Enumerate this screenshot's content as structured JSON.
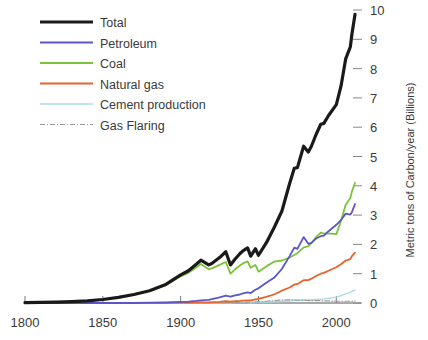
{
  "chart_data": {
    "type": "line",
    "title": "",
    "subtitle": "",
    "xlabel": "",
    "ylabel": "Metric tons of Carbon/year (Billions)",
    "ylabel_position": "right",
    "xlim": [
      1800,
      2012
    ],
    "ylim": [
      0,
      10
    ],
    "xticks": [
      1800,
      1850,
      1900,
      1950,
      2000
    ],
    "xtick_labels": [
      "1800",
      "1850",
      "1900",
      "1950",
      "2000"
    ],
    "yticks": [
      0,
      1,
      2,
      3,
      4,
      5,
      6,
      7,
      8,
      9,
      10
    ],
    "ytick_labels": [
      "0",
      "1",
      "2",
      "3",
      "4",
      "5",
      "6",
      "7",
      "8",
      "9",
      "10"
    ],
    "grid": false,
    "legend_position": "upper-left",
    "x": [
      1800,
      1810,
      1820,
      1830,
      1840,
      1850,
      1860,
      1870,
      1880,
      1890,
      1900,
      1905,
      1910,
      1913,
      1918,
      1920,
      1925,
      1929,
      1932,
      1935,
      1938,
      1940,
      1943,
      1945,
      1948,
      1950,
      1955,
      1960,
      1965,
      1970,
      1973,
      1975,
      1979,
      1982,
      1984,
      1987,
      1990,
      1992,
      1995,
      2000,
      2003,
      2006,
      2009,
      2010,
      2012
    ],
    "series": [
      {
        "name": "Total",
        "color": "#1a1a1a",
        "linewidth": 3.2,
        "style": "solid",
        "values": [
          0.01,
          0.02,
          0.03,
          0.05,
          0.07,
          0.12,
          0.19,
          0.29,
          0.42,
          0.62,
          0.96,
          1.1,
          1.32,
          1.46,
          1.3,
          1.35,
          1.55,
          1.75,
          1.3,
          1.5,
          1.68,
          1.78,
          1.88,
          1.6,
          1.85,
          1.63,
          2.05,
          2.57,
          3.13,
          4.08,
          4.6,
          4.62,
          5.35,
          5.15,
          5.35,
          5.75,
          6.1,
          6.13,
          6.4,
          6.77,
          7.4,
          8.33,
          8.74,
          9.17,
          9.85
        ]
      },
      {
        "name": "Petroleum",
        "color": "#5b55c9",
        "linewidth": 1.8,
        "style": "solid",
        "values": [
          0,
          0,
          0,
          0,
          0,
          0,
          0,
          0,
          0.01,
          0.02,
          0.04,
          0.05,
          0.07,
          0.09,
          0.11,
          0.13,
          0.19,
          0.25,
          0.22,
          0.26,
          0.29,
          0.33,
          0.36,
          0.34,
          0.45,
          0.5,
          0.69,
          0.86,
          1.16,
          1.6,
          1.89,
          1.85,
          2.25,
          2.02,
          2.05,
          2.2,
          2.28,
          2.3,
          2.45,
          2.67,
          2.83,
          3.05,
          3.02,
          3.1,
          3.38
        ]
      },
      {
        "name": "Coal",
        "color": "#7cc23a",
        "linewidth": 1.8,
        "style": "solid",
        "values": [
          0.01,
          0.02,
          0.03,
          0.05,
          0.07,
          0.12,
          0.19,
          0.29,
          0.41,
          0.6,
          0.91,
          1.03,
          1.21,
          1.33,
          1.15,
          1.18,
          1.3,
          1.4,
          1.0,
          1.15,
          1.28,
          1.35,
          1.42,
          1.2,
          1.3,
          1.07,
          1.25,
          1.41,
          1.45,
          1.55,
          1.64,
          1.7,
          1.9,
          1.93,
          2.05,
          2.25,
          2.4,
          2.37,
          2.38,
          2.35,
          2.8,
          3.35,
          3.58,
          3.8,
          4.1
        ]
      },
      {
        "name": "Natural gas",
        "color": "#e8622c",
        "linewidth": 1.8,
        "style": "solid",
        "values": [
          0,
          0,
          0,
          0,
          0,
          0,
          0,
          0,
          0,
          0,
          0.01,
          0.01,
          0.02,
          0.02,
          0.02,
          0.03,
          0.04,
          0.06,
          0.05,
          0.06,
          0.07,
          0.08,
          0.09,
          0.09,
          0.12,
          0.14,
          0.21,
          0.29,
          0.42,
          0.53,
          0.63,
          0.65,
          0.78,
          0.78,
          0.83,
          0.92,
          1.0,
          1.03,
          1.1,
          1.22,
          1.32,
          1.45,
          1.5,
          1.6,
          1.72
        ]
      },
      {
        "name": "Cement production",
        "color": "#a8dde8",
        "linewidth": 1.4,
        "style": "solid",
        "values": [
          0,
          0,
          0,
          0,
          0,
          0,
          0,
          0,
          0,
          0,
          0,
          0,
          0.01,
          0.01,
          0.01,
          0.01,
          0.01,
          0.02,
          0.01,
          0.02,
          0.02,
          0.02,
          0.02,
          0.01,
          0.02,
          0.02,
          0.03,
          0.04,
          0.05,
          0.07,
          0.08,
          0.08,
          0.1,
          0.1,
          0.11,
          0.12,
          0.13,
          0.14,
          0.16,
          0.2,
          0.25,
          0.31,
          0.36,
          0.4,
          0.44
        ]
      },
      {
        "name": "Gas Flaring",
        "color": "#9a9a9a",
        "linewidth": 1.2,
        "style": "dashdot",
        "values": [
          0,
          0,
          0,
          0,
          0,
          0,
          0,
          0,
          0,
          0,
          0,
          0,
          0,
          0,
          0,
          0.01,
          0.01,
          0.02,
          0.02,
          0.02,
          0.02,
          0.02,
          0.03,
          0.03,
          0.04,
          0.04,
          0.06,
          0.08,
          0.1,
          0.11,
          0.11,
          0.1,
          0.1,
          0.08,
          0.08,
          0.08,
          0.08,
          0.07,
          0.07,
          0.06,
          0.06,
          0.06,
          0.06,
          0.06,
          0.07
        ]
      }
    ],
    "legend": [
      {
        "label": "Total",
        "color": "#1a1a1a"
      },
      {
        "label": "Petroleum",
        "color": "#5b55c9"
      },
      {
        "label": "Coal",
        "color": "#7cc23a"
      },
      {
        "label": "Natural gas",
        "color": "#e8622c"
      },
      {
        "label": "Cement production",
        "color": "#a8dde8"
      },
      {
        "label": "Gas Flaring",
        "color": "#9a9a9a"
      }
    ]
  }
}
